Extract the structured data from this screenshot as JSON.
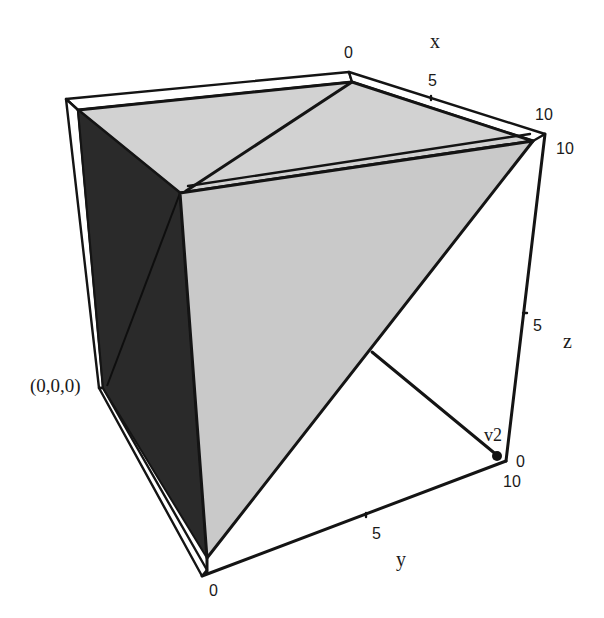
{
  "figure": {
    "type": "3d-polyhedron-plot",
    "colors": {
      "background": "#ffffff",
      "face_light": "#c9c9c9",
      "face_top": "#d2d2d2",
      "face_dark": "#2a2a2a",
      "edge": "#141414"
    }
  },
  "axes": {
    "x": {
      "label": "x",
      "ticks": [
        "0",
        "5",
        "10"
      ]
    },
    "y": {
      "label": "y",
      "ticks": [
        "0",
        "5",
        "10"
      ]
    },
    "z": {
      "label": "z",
      "ticks": [
        "0",
        "5",
        "10"
      ]
    }
  },
  "annotations": {
    "origin_label": "(0,0,0)",
    "vertex_label": "v2"
  }
}
